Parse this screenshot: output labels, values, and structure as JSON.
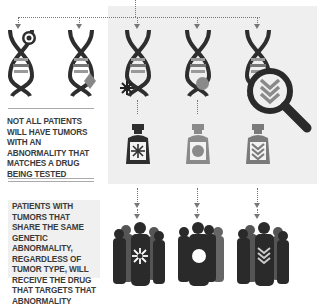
{
  "infographic": {
    "left_note_1": "Not all patients will have tumors with an abnormality that matches a drug being tested",
    "left_note_2": "Patients with tumors that share the same genetic abnormality, regardless of tumor type, will receive the drug that targets that abnormality",
    "colors": {
      "panel_bg": "#efefef",
      "dark": "#2e2e2e",
      "mid": "#7a7a7a",
      "light": "#9a9a9a",
      "dotted_line": "#777777"
    },
    "dna_strands": [
      {
        "marker": "target-icon",
        "highlighted": false
      },
      {
        "marker": "diamond-icon",
        "highlighted": false
      },
      {
        "marker": "asterisk-icon",
        "highlighted": true
      },
      {
        "marker": "circle-icon",
        "highlighted": true
      },
      {
        "marker": "chevron-icon",
        "highlighted": true
      }
    ],
    "drugs": [
      {
        "label_icon": "asterisk-icon",
        "color": "#2e2e2e"
      },
      {
        "label_icon": "circle-icon",
        "color": "#8a8a8a"
      },
      {
        "label_icon": "chevron-icon",
        "color": "#7a7a7a"
      }
    ],
    "patient_groups": [
      {
        "icon": "asterisk-icon"
      },
      {
        "icon": "circle-icon"
      },
      {
        "icon": "chevron-icon"
      }
    ],
    "magnifier": "magnifying-glass-icon"
  }
}
